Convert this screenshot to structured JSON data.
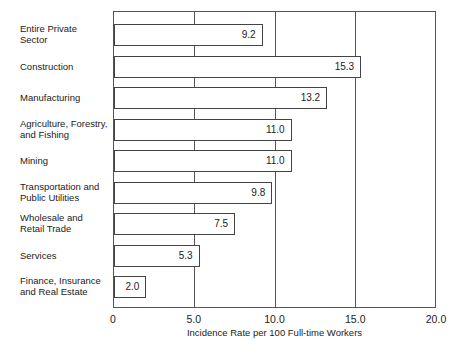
{
  "chart_data": {
    "type": "bar",
    "orientation": "horizontal",
    "title": "",
    "xlabel": "Incidence Rate per 100 Full-time Workers",
    "ylabel": "",
    "xlim": [
      0,
      20
    ],
    "x_ticks": [
      "0",
      "5.0",
      "10.0",
      "15.0",
      "20.0"
    ],
    "grid": true,
    "categories": [
      "Entire Private Sector",
      "Construction",
      "Manufacturing",
      "Agriculture, Forestry, and Fishing",
      "Mining",
      "Transportation and Public Utilities",
      "Wholesale and Retail Trade",
      "Services",
      "Finance, Insurance and Real Estate"
    ],
    "values": [
      9.2,
      15.3,
      13.2,
      11.0,
      11.0,
      9.8,
      7.5,
      5.3,
      2.0
    ],
    "value_labels": [
      "9.2",
      "15.3",
      "13.2",
      "11.0",
      "11.0",
      "9.8",
      "7.5",
      "5.3",
      "2.0"
    ]
  },
  "labels": {
    "cat0": [
      "Entire Private",
      "Sector"
    ],
    "cat1": [
      "Construction"
    ],
    "cat2": [
      "Manufacturing"
    ],
    "cat3": [
      "Agriculture, Forestry,",
      "and Fishing"
    ],
    "cat4": [
      "Mining"
    ],
    "cat5": [
      "Transportation and",
      "Public Utilities"
    ],
    "cat6": [
      "Wholesale and",
      "Retail Trade"
    ],
    "cat7": [
      "Services"
    ],
    "cat8": [
      "Finance, Insurance",
      "and Real Estate"
    ]
  }
}
